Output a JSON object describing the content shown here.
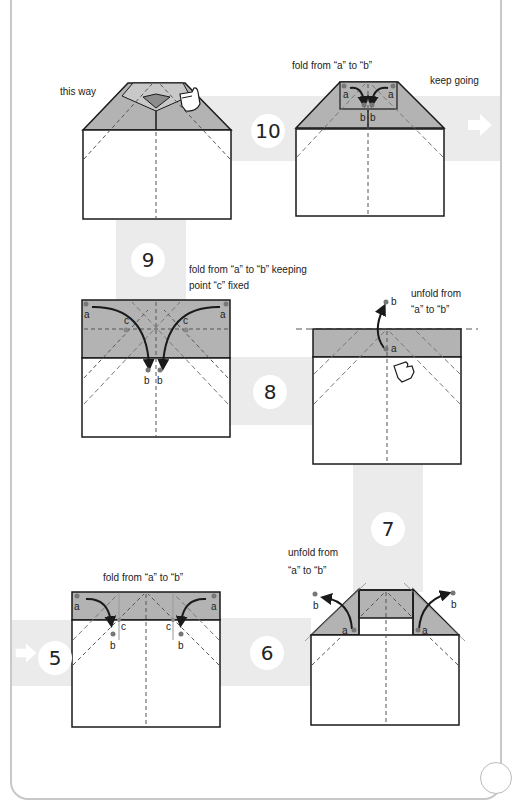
{
  "steps": {
    "s5": {
      "number": "5",
      "instruction": "fold from “a” to “b”"
    },
    "s6": {
      "number": "6",
      "instruction_line1": "unfold from",
      "instruction_line2": "“a” to “b”"
    },
    "s7": {
      "number": "7"
    },
    "s8": {
      "number": "8",
      "instruction_line1": "unfold from",
      "instruction_line2": "“a” to “b”"
    },
    "s9": {
      "number": "9",
      "instruction_line1": "fold from “a” to “b” keeping",
      "instruction_line2": "point “c” fixed"
    },
    "s10": {
      "number": "10",
      "instruction": "fold from “a” to “b”",
      "hint": "this way"
    }
  },
  "continue_label": "keep going",
  "point_labels": {
    "a": "a",
    "b": "b",
    "c": "c"
  },
  "icons": {
    "next_arrow": "right-arrow-icon",
    "hand": "hand-pointer-icon"
  },
  "colors": {
    "band": "#ebebeb",
    "fold_gray": "#b3b3b3",
    "line": "#1a1a1a",
    "dash": "#555555",
    "point": "#777777",
    "border": "#c8c8c8"
  }
}
